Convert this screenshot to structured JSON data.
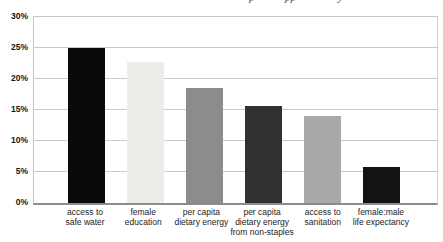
{
  "page": {
    "background": "#ffffff",
    "clipped_caption": {
      "note": "caption text cut off by top edge of screenshot; only letter descenders visible",
      "descenders": [
        {
          "glyph": "p",
          "x": 249
        },
        {
          "glyph": "pp",
          "x": 285
        },
        {
          "glyph": "y",
          "x": 338
        }
      ]
    }
  },
  "chart_data": {
    "type": "bar",
    "title": "",
    "xlabel": "",
    "ylabel": "",
    "categories": [
      "access to safe water",
      "female education",
      "per capita dietary energy",
      "per capita dietary energy from non-staples",
      "access to sanitation",
      "female:male life expectancy"
    ],
    "category_label_lines": [
      [
        "access to",
        "safe water"
      ],
      [
        "female",
        "education"
      ],
      [
        "per capita",
        "dietary energy"
      ],
      [
        "per capita",
        "dietary energy",
        "from non-staples"
      ],
      [
        "access to",
        "sanitation"
      ],
      [
        "female:male",
        "life expectancy"
      ]
    ],
    "values": [
      25.0,
      22.7,
      18.5,
      15.7,
      14.0,
      5.8
    ],
    "bar_colors": [
      "#0a0a0a",
      "#edece6",
      "#8c8c8c",
      "#313131",
      "#a9a9a9",
      "#131313"
    ],
    "ylim": [
      0,
      30
    ],
    "y_ticks": [
      0,
      5,
      10,
      15,
      20,
      25,
      30
    ],
    "y_tick_labels": [
      "0%",
      "5%",
      "10%",
      "15%",
      "20%",
      "25%",
      "30%"
    ],
    "grid": true,
    "legend": "none"
  },
  "colors": {
    "gridline": "#c9c9c9",
    "axis_bottom": "#8c8c8c",
    "tick_label": "#151515",
    "category_label": "#1c1c1c"
  }
}
